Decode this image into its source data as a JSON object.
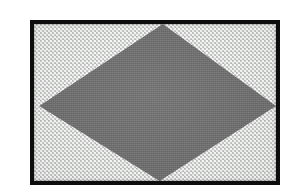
{
  "figure": {
    "kind": "scanned-halftone-plate",
    "caption": "",
    "label": "",
    "notes": ""
  },
  "canvas": {
    "width": 302,
    "height": 195,
    "background_color": "#ffffff"
  },
  "plate": {
    "left": 30,
    "top": 20,
    "width": 250,
    "height": 165,
    "frame_color": "#0d0d0d",
    "frame_thickness": 4
  },
  "background_field": {
    "name": "stippled-light-field",
    "base_color": "#cfd1cf",
    "dot_color": "#ffffff",
    "pattern": "staggered-dot-stipple",
    "dot_pitch_px": 4
  },
  "diamond": {
    "name": "central-rhombus",
    "fill_color": "#6e6e6e",
    "vertices_percent": {
      "top": [
        53.2,
        0.0
      ],
      "right": [
        100.0,
        52.2
      ],
      "bottom": [
        51.9,
        100.0
      ],
      "left": [
        2.2,
        52.2
      ]
    }
  },
  "text_content": {
    "has_text": false,
    "strings": []
  }
}
